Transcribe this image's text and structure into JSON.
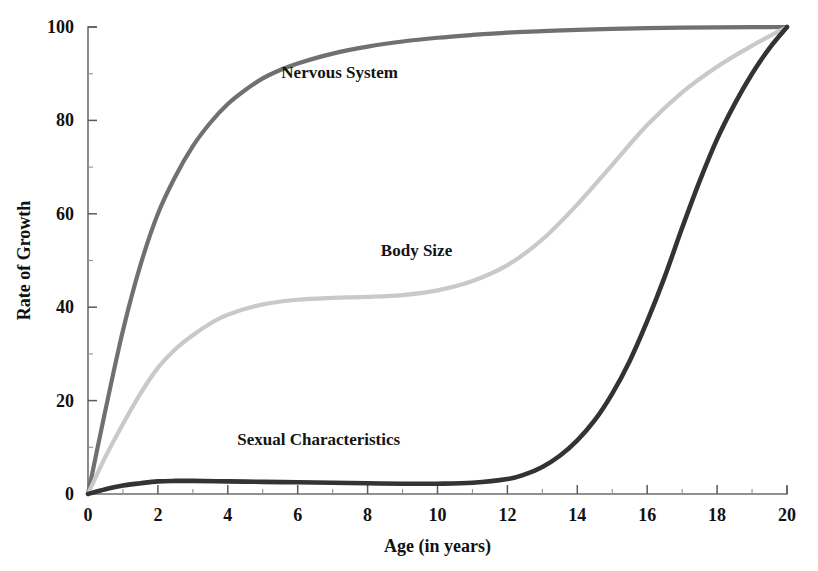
{
  "chart_data": {
    "type": "line",
    "title": "",
    "subtitle": "",
    "xlabel": "Age (in years)",
    "ylabel": "Rate of Growth",
    "xlim": [
      0,
      20
    ],
    "ylim": [
      0,
      100
    ],
    "xticks": [
      0,
      2,
      4,
      6,
      8,
      10,
      12,
      14,
      16,
      18,
      20
    ],
    "xticklabels": [
      "0",
      "2",
      "4",
      "6",
      "8",
      "10",
      "12",
      "14",
      "16",
      "18",
      "20"
    ],
    "xminorticks": [
      1,
      3,
      5,
      7,
      9,
      11,
      13,
      15,
      17,
      19
    ],
    "yticks": [
      0,
      20,
      40,
      60,
      80,
      100
    ],
    "yticklabels": [
      "0",
      "20",
      "40",
      "60",
      "80",
      "100"
    ],
    "yminorticks": [
      10,
      30,
      50,
      70,
      90
    ],
    "grid": false,
    "legend_position": "inline-annotations",
    "series": [
      {
        "name": "Nervous System",
        "color": "#707070",
        "width": 4.2,
        "label_x": 7.2,
        "label_y": 89,
        "x": [
          0,
          0.5,
          1,
          1.5,
          2,
          2.5,
          3,
          3.5,
          4,
          4.5,
          5,
          5.5,
          6,
          7,
          8,
          9,
          10,
          11,
          12,
          13,
          14,
          15,
          16,
          17,
          18,
          19,
          20
        ],
        "values": [
          0,
          18,
          35,
          49,
          60,
          68,
          74.5,
          79.5,
          83.5,
          86.5,
          89,
          90.8,
          92.2,
          94.3,
          95.8,
          96.9,
          97.7,
          98.3,
          98.8,
          99.1,
          99.4,
          99.6,
          99.75,
          99.85,
          99.92,
          99.97,
          100
        ]
      },
      {
        "name": "Body Size",
        "color": "#c9c9c9",
        "width": 4.2,
        "label_x": 9.4,
        "label_y": 51,
        "x": [
          0,
          0.5,
          1,
          1.5,
          2,
          2.5,
          3,
          3.5,
          4,
          5,
          6,
          7,
          8,
          9,
          10,
          11,
          12,
          13,
          14,
          15,
          16,
          17,
          18,
          19,
          20
        ],
        "values": [
          0,
          8,
          15,
          21.5,
          27,
          31,
          34,
          36.5,
          38.4,
          40.6,
          41.6,
          42,
          42.2,
          42.6,
          43.6,
          45.6,
          49,
          54.5,
          62,
          70.5,
          79,
          86,
          91.5,
          96,
          100
        ]
      },
      {
        "name": "Sexual Characteristics",
        "color": "#333333",
        "width": 4.6,
        "label_x": 6.6,
        "label_y": 10.5,
        "x": [
          0,
          0.5,
          1,
          1.5,
          2,
          2.5,
          3,
          4,
          5,
          6,
          7,
          8,
          9,
          10,
          11,
          12,
          12.5,
          13,
          13.5,
          14,
          14.5,
          15,
          15.5,
          16,
          16.5,
          17,
          17.5,
          18,
          18.5,
          19,
          19.5,
          20
        ],
        "values": [
          0,
          1.0,
          1.8,
          2.3,
          2.7,
          2.8,
          2.8,
          2.7,
          2.6,
          2.5,
          2.4,
          2.3,
          2.2,
          2.2,
          2.4,
          3.2,
          4.2,
          5.8,
          8.2,
          11.5,
          15.8,
          21.5,
          28.5,
          37,
          46.5,
          57,
          67,
          76,
          83.5,
          90,
          95.5,
          100
        ]
      }
    ]
  },
  "geometry": {
    "plot_left": 88,
    "plot_right": 787,
    "plot_top": 27,
    "plot_bottom": 494
  },
  "axis": {
    "y_title": "Rate of Growth",
    "x_title": "Age (in years)"
  }
}
